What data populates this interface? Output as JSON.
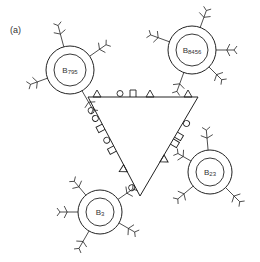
{
  "figure": {
    "panel_label": "(a)",
    "stroke_color": "#222222",
    "background": "#ffffff",
    "triangle": {
      "vertices": [
        [
          88,
          97
        ],
        [
          198,
          97
        ],
        [
          140,
          196
        ]
      ],
      "top_edge_symbols": [
        {
          "shape": "triangle",
          "x": 97,
          "y": 97
        },
        {
          "shape": "circle",
          "x": 120,
          "y": 97
        },
        {
          "shape": "square",
          "x": 133,
          "y": 97
        },
        {
          "shape": "triangle",
          "x": 150,
          "y": 97
        },
        {
          "shape": "triangle",
          "x": 188,
          "y": 97
        }
      ],
      "left_edge_symbols": [
        {
          "shape": "circle",
          "t": 0.12
        },
        {
          "shape": "circle",
          "t": 0.2
        },
        {
          "shape": "square",
          "t": 0.3
        },
        {
          "shape": "circle",
          "t": 0.42
        },
        {
          "shape": "square",
          "t": 0.52
        },
        {
          "shape": "triangle",
          "t": 0.72
        },
        {
          "shape": "circle",
          "t": 0.9
        }
      ],
      "right_edge_symbols": [
        {
          "shape": "circle",
          "t": 0.25
        },
        {
          "shape": "square",
          "t": 0.38
        },
        {
          "shape": "square",
          "t": 0.45
        },
        {
          "shape": "triangle",
          "t": 0.62
        }
      ]
    },
    "cells": [
      {
        "id": "B795",
        "label_main": "B",
        "label_sub": "795",
        "cx": 70,
        "cy": 70,
        "r_outer": 24,
        "r_inner": 16,
        "antennae": [
          [
            -105,
            22
          ],
          [
            -35,
            20
          ],
          [
            160,
            18
          ],
          [
            60,
            22
          ]
        ]
      },
      {
        "id": "B8456",
        "label_main": "B",
        "label_sub": "8456",
        "cx": 192,
        "cy": 50,
        "r_outer": 24,
        "r_inner": 16,
        "antennae": [
          [
            -70,
            18
          ],
          [
            200,
            20
          ],
          [
            0,
            18
          ],
          [
            45,
            18
          ],
          [
            110,
            20
          ]
        ]
      },
      {
        "id": "B23",
        "label_main": "B",
        "label_sub": "23",
        "cx": 210,
        "cy": 172,
        "r_outer": 22,
        "r_inner": 14,
        "antennae": [
          [
            -95,
            20
          ],
          [
            -150,
            15
          ],
          [
            140,
            20
          ],
          [
            45,
            20
          ]
        ]
      },
      {
        "id": "B3",
        "label_main": "B",
        "label_sub": "3",
        "cx": 100,
        "cy": 212,
        "r_outer": 22,
        "r_inner": 14,
        "antennae": [
          [
            -130,
            18
          ],
          [
            180,
            18
          ],
          [
            120,
            20
          ],
          [
            -35,
            18
          ],
          [
            30,
            18
          ]
        ]
      }
    ]
  }
}
